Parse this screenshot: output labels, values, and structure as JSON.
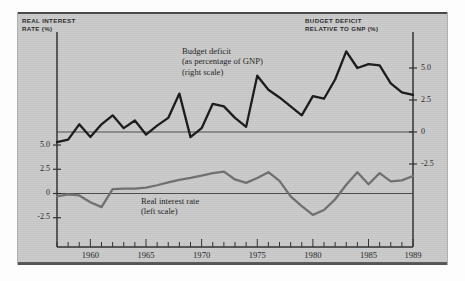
{
  "figure": {
    "background_color": "#c9c9c9",
    "deficit_color": "#171717",
    "rate_color": "#6e6e6e"
  },
  "headers": {
    "left": "REAL INTEREST\nRATE (%)",
    "left_line1": "REAL INTEREST",
    "left_line2": "RATE (%)",
    "right_line1": "BUDGET DEFICIT",
    "right_line2": "RELATIVE TO GNP (%)"
  },
  "annotations": {
    "deficit_line1": "Budget deficit",
    "deficit_line2": "(as percentage of GNP)",
    "deficit_line3": "(right scale)",
    "rate_line1": "Real interest rate",
    "rate_line2": "(left scale)"
  },
  "chart_data": {
    "type": "line",
    "title": "",
    "xlabel": "",
    "ylabel": "Real interest rate (%)",
    "y2label": "Budget deficit relative to GNP (%)",
    "grid": false,
    "legend": "inline-annotations",
    "xlim": [
      1957,
      1989
    ],
    "xticks": [
      1957,
      1958,
      1959,
      1960,
      1961,
      1962,
      1963,
      1964,
      1965,
      1966,
      1967,
      1968,
      1969,
      1970,
      1971,
      1972,
      1973,
      1974,
      1975,
      1976,
      1977,
      1978,
      1979,
      1980,
      1981,
      1982,
      1983,
      1984,
      1985,
      1986,
      1987,
      1988,
      1989
    ],
    "xtick_labels": [
      "1960",
      "1965",
      "1970",
      "1975",
      "1980",
      "1985",
      "1989"
    ],
    "xtick_label_years": [
      1960,
      1965,
      1970,
      1975,
      1980,
      1985,
      1989
    ],
    "left_axis": {
      "label": "REAL INTEREST RATE (%)",
      "ticks": [
        5.0,
        2.5,
        0,
        -2.5
      ],
      "tick_labels": [
        "5.0",
        "2.5",
        "0",
        "-2.5"
      ],
      "ylim": [
        -4.2,
        6.4
      ]
    },
    "right_axis": {
      "label": "BUDGET DEFICIT RELATIVE TO GNP (%)",
      "ticks": [
        5.0,
        2.5,
        0,
        -2.5
      ],
      "tick_labels": [
        "5.0",
        "2.5",
        "0",
        "-2.5"
      ],
      "ylim": [
        -3.2,
        7.0
      ]
    },
    "x": [
      1957,
      1958,
      1959,
      1960,
      1961,
      1962,
      1963,
      1964,
      1965,
      1966,
      1967,
      1968,
      1969,
      1970,
      1971,
      1972,
      1973,
      1974,
      1975,
      1976,
      1977,
      1978,
      1979,
      1980,
      1981,
      1982,
      1983,
      1984,
      1985,
      1986,
      1987,
      1988,
      1989
    ],
    "series": [
      {
        "name": "Budget deficit (as percentage of GNP)",
        "scale": "right",
        "color": "#171717",
        "values": [
          -0.8,
          -0.6,
          0.6,
          -0.4,
          0.6,
          1.3,
          0.3,
          0.9,
          -0.2,
          0.5,
          1.1,
          3.0,
          -0.4,
          0.3,
          2.2,
          2.0,
          1.1,
          0.4,
          4.4,
          3.3,
          2.7,
          2.0,
          1.3,
          2.8,
          2.6,
          4.1,
          6.3,
          5.0,
          5.3,
          5.2,
          3.8,
          3.1,
          2.9
        ]
      },
      {
        "name": "Real interest rate",
        "scale": "left",
        "color": "#6e6e6e",
        "values": [
          -0.3,
          -0.1,
          -0.2,
          -0.9,
          -1.4,
          0.45,
          0.5,
          0.5,
          0.6,
          0.85,
          1.15,
          1.4,
          1.6,
          1.85,
          2.1,
          2.25,
          1.45,
          1.1,
          1.6,
          2.2,
          1.3,
          -0.3,
          -1.3,
          -2.2,
          -1.7,
          -0.6,
          0.9,
          2.2,
          0.95,
          2.1,
          1.25,
          1.35,
          1.8
        ]
      }
    ]
  }
}
